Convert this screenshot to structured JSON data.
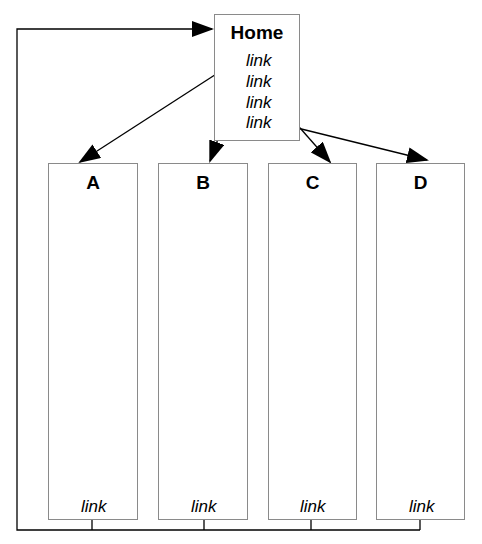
{
  "home": {
    "title": "Home",
    "links": [
      "link",
      "link",
      "link",
      "link"
    ]
  },
  "pages": [
    {
      "title": "A",
      "link": "link"
    },
    {
      "title": "B",
      "link": "link"
    },
    {
      "title": "C",
      "link": "link"
    },
    {
      "title": "D",
      "link": "link"
    }
  ],
  "colors": {
    "line": "#000000",
    "box_border": "#8a8a8a"
  }
}
